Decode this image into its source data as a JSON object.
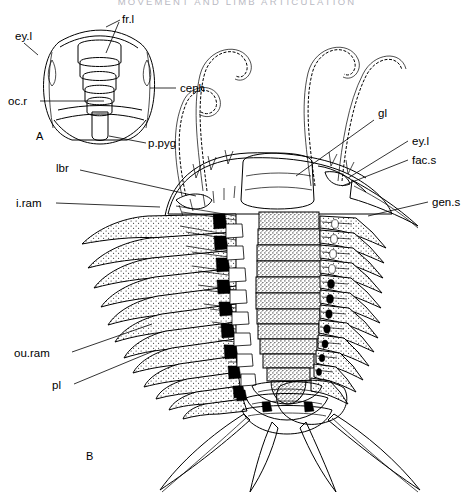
{
  "page": {
    "running_head": "MOVEMENT AND LIMB ARTICULATION",
    "folio": "",
    "background_color": "#ffffff",
    "ink_color": "#000000"
  },
  "figures": [
    {
      "id": "A",
      "caption_id": "A",
      "description": "Outline diagram of trilobite cephalon in dorsal view",
      "labels": [
        {
          "key": "fr.l",
          "text": "fr.l",
          "anchor": "frontal-lobe",
          "side": "top-right"
        },
        {
          "key": "ey.l",
          "text": "ey.l",
          "anchor": "eye-lobe",
          "side": "left"
        },
        {
          "key": "ceph",
          "text": "ceph",
          "anchor": "cephalon",
          "side": "right"
        },
        {
          "key": "oc.r",
          "text": "oc.r",
          "anchor": "occipital-ring",
          "side": "left"
        },
        {
          "key": "p.pyg",
          "text": "p.pyg",
          "anchor": "proto-pygidium",
          "side": "bottom-right"
        }
      ]
    },
    {
      "id": "B",
      "caption_id": "B",
      "description": "Trilobite with antennae, biramous appendages, pleural and pygidial spines",
      "labels": [
        {
          "key": "lbr",
          "text": "lbr",
          "anchor": "labrum",
          "side": "left"
        },
        {
          "key": "i.ram",
          "text": "i.ram",
          "anchor": "inner-ramus",
          "side": "left"
        },
        {
          "key": "ou.ram",
          "text": "ou.ram",
          "anchor": "outer-ramus",
          "side": "left"
        },
        {
          "key": "pl",
          "text": "pl",
          "anchor": "pleuron",
          "side": "left"
        },
        {
          "key": "gl",
          "text": "gl",
          "anchor": "glabella",
          "side": "right"
        },
        {
          "key": "ey.l",
          "text": "ey.l",
          "anchor": "eye-lobe",
          "side": "right"
        },
        {
          "key": "fac.s",
          "text": "fac.s",
          "anchor": "facial-suture",
          "side": "right"
        },
        {
          "key": "gen.s",
          "text": "gen.s",
          "anchor": "genal-spine",
          "side": "right"
        }
      ],
      "counts": {
        "antennae": 4,
        "axial_segments": 12,
        "left_limb_pairs": 13,
        "right_limb_pairs": 13,
        "pygidial_spines": 4
      }
    }
  ]
}
